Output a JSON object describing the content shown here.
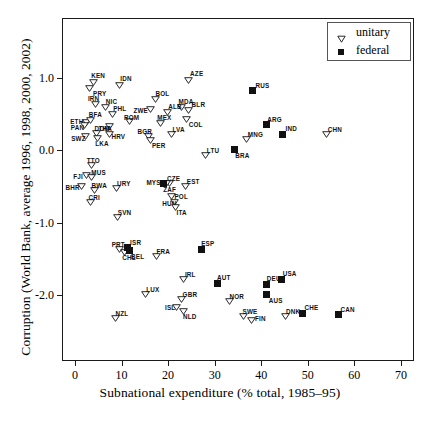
{
  "chart_data": {
    "type": "scatter",
    "title": "",
    "xlabel": "Subnational expenditure (% total, 1985–95)",
    "ylabel": "Corruption (World Bank, average 1996, 1998, 2000, 2002)",
    "xlim": [
      -3,
      73
    ],
    "ylim": [
      -2.75,
      1.45
    ],
    "xticks": [
      0,
      10,
      20,
      30,
      40,
      50,
      60,
      70
    ],
    "xticklabels": [
      "0",
      "10",
      "20",
      "30",
      "40",
      "50",
      "60",
      "70"
    ],
    "yticks": [
      1.0,
      0.0,
      -1.0,
      -2.0
    ],
    "yticklabels": [
      "1.0",
      "0.0",
      "-1.0",
      "-2.0"
    ],
    "grid": false,
    "legend": {
      "position": "top-right",
      "entries": [
        {
          "label": "unitary",
          "marker": "open-triangle-down"
        },
        {
          "label": "federal",
          "marker": "filled-square"
        }
      ]
    },
    "series": [
      {
        "name": "unitary",
        "marker": "open-triangle-down",
        "points": [
          {
            "label": "KEN",
            "x": 3.9,
            "y": 0.94,
            "lx": -2,
            "ly": -10
          },
          {
            "label": "PRY",
            "x": 3.0,
            "y": 0.85,
            "lx": 4,
            "ly": 2
          },
          {
            "label": "IDN",
            "x": 9.5,
            "y": 0.9,
            "lx": 1,
            "ly": -10
          },
          {
            "label": "AZE",
            "x": 24.3,
            "y": 0.97,
            "lx": 2,
            "ly": -10
          },
          {
            "label": "IRN",
            "x": 4.5,
            "y": 0.63,
            "lx": -8,
            "ly": -9
          },
          {
            "label": "NIC",
            "x": 6.6,
            "y": 0.6,
            "lx": 0,
            "ly": -9
          },
          {
            "label": "PHL",
            "x": 8.0,
            "y": 0.5,
            "lx": 1,
            "ly": -9
          },
          {
            "label": "BOL",
            "x": 17.3,
            "y": 0.7,
            "lx": 0,
            "ly": -9
          },
          {
            "label": "ZWE",
            "x": 16.2,
            "y": 0.57,
            "lx": -17,
            "ly": -2
          },
          {
            "label": "MDA",
            "x": 22.9,
            "y": 0.6,
            "lx": -3,
            "ly": -9
          },
          {
            "label": "BLR",
            "x": 24.4,
            "y": 0.55,
            "lx": 3,
            "ly": -9
          },
          {
            "label": "ALB",
            "x": 19.8,
            "y": 0.53,
            "lx": 1,
            "ly": -9
          },
          {
            "label": "COL",
            "x": 24.0,
            "y": 0.43,
            "lx": 2,
            "ly": 2
          },
          {
            "label": "ETH",
            "x": 2.4,
            "y": 0.39,
            "lx": -16,
            "ly": -4
          },
          {
            "label": "BFA",
            "x": 3.4,
            "y": 0.41,
            "lx": -2,
            "ly": -9
          },
          {
            "label": "THA",
            "x": 7.4,
            "y": 0.33,
            "lx": -11,
            "ly": -1
          },
          {
            "label": "ROM",
            "x": 11.8,
            "y": 0.4,
            "lx": -6,
            "ly": -7
          },
          {
            "label": "PAN",
            "x": 2.1,
            "y": 0.34,
            "lx": -14,
            "ly": -1
          },
          {
            "label": "DOM",
            "x": 4.6,
            "y": 0.24,
            "lx": -2,
            "ly": -8
          },
          {
            "label": "HRV",
            "x": 7.4,
            "y": 0.22,
            "lx": 2,
            "ly": -1
          },
          {
            "label": "LKA",
            "x": 4.8,
            "y": 0.17,
            "lx": -2,
            "ly": 2
          },
          {
            "label": "SWZ",
            "x": 2.2,
            "y": 0.19,
            "lx": -14,
            "ly": -1
          },
          {
            "label": "BGR",
            "x": 15.8,
            "y": 0.2,
            "lx": -11,
            "ly": -8
          },
          {
            "label": "PER",
            "x": 16.3,
            "y": 0.14,
            "lx": 1,
            "ly": 2
          },
          {
            "label": "MEX",
            "x": 18.3,
            "y": 0.38,
            "lx": -3,
            "ly": -9
          },
          {
            "label": "LVA",
            "x": 20.7,
            "y": 0.22,
            "lx": 1,
            "ly": -8
          },
          {
            "label": "MNG",
            "x": 36.9,
            "y": 0.15,
            "lx": 1,
            "ly": -8
          },
          {
            "label": "CHN",
            "x": 54.1,
            "y": 0.22,
            "lx": 1,
            "ly": -8
          },
          {
            "label": "LTU",
            "x": 28.1,
            "y": -0.07,
            "lx": 1,
            "ly": -8
          },
          {
            "label": "TTO",
            "x": 3.6,
            "y": -0.2,
            "lx": -5,
            "ly": -8
          },
          {
            "label": "FJI",
            "x": 2.4,
            "y": -0.35,
            "lx": -13,
            "ly": -2
          },
          {
            "label": "MUS",
            "x": 3.5,
            "y": -0.37,
            "lx": 0,
            "ly": -8
          },
          {
            "label": "BHR",
            "x": 1.4,
            "y": -0.49,
            "lx": -16,
            "ly": -2
          },
          {
            "label": "BWA",
            "x": 4.2,
            "y": -0.55,
            "lx": -3,
            "ly": -8
          },
          {
            "label": "URY",
            "x": 8.8,
            "y": -0.52,
            "lx": 1,
            "ly": -8
          },
          {
            "label": "CRI",
            "x": 3.3,
            "y": -0.72,
            "lx": -2,
            "ly": -8
          },
          {
            "label": "SVN",
            "x": 9.2,
            "y": -0.92,
            "lx": 0,
            "ly": -8
          },
          {
            "label": "CZE",
            "x": 20.2,
            "y": -0.45,
            "lx": -2,
            "ly": -8
          },
          {
            "label": "ZAF",
            "x": 19.6,
            "y": -0.45,
            "lx": -3,
            "ly": 3
          },
          {
            "label": "EST",
            "x": 23.8,
            "y": -0.5,
            "lx": 1,
            "ly": -8
          },
          {
            "label": "POL",
            "x": 20.7,
            "y": -0.63,
            "lx": 3,
            "ly": -3
          },
          {
            "label": "HUN",
            "x": 21.3,
            "y": -0.72,
            "lx": -12,
            "ly": -2
          },
          {
            "label": "ITA",
            "x": 21.6,
            "y": -0.78,
            "lx": 1,
            "ly": 2
          },
          {
            "label": "PRT",
            "x": 9.6,
            "y": -1.37,
            "lx": -8,
            "ly": -8
          },
          {
            "label": "CHL",
            "x": 10.6,
            "y": -1.4,
            "lx": -2,
            "ly": 2
          },
          {
            "label": "FRA",
            "x": 17.5,
            "y": -1.46,
            "lx": 0,
            "ly": -8
          },
          {
            "label": "IRL",
            "x": 23.4,
            "y": -1.78,
            "lx": 1,
            "ly": -8
          },
          {
            "label": "LUX",
            "x": 15.1,
            "y": -1.98,
            "lx": 1,
            "ly": -8
          },
          {
            "label": "GBR",
            "x": 22.9,
            "y": -2.05,
            "lx": 1,
            "ly": -8
          },
          {
            "label": "ISL",
            "x": 21.7,
            "y": -2.16,
            "lx": -11,
            "ly": -3
          },
          {
            "label": "NLD",
            "x": 23.2,
            "y": -2.22,
            "lx": 0,
            "ly": 2
          },
          {
            "label": "NZL",
            "x": 8.7,
            "y": -2.31,
            "lx": 0,
            "ly": -8
          },
          {
            "label": "NOR",
            "x": 33.2,
            "y": -2.08,
            "lx": 0,
            "ly": -8
          },
          {
            "label": "SWE",
            "x": 36.2,
            "y": -2.29,
            "lx": -1,
            "ly": -8
          },
          {
            "label": "FIN",
            "x": 38.0,
            "y": -2.35,
            "lx": 3,
            "ly": -5
          },
          {
            "label": "DNK",
            "x": 45.3,
            "y": -2.29,
            "lx": 0,
            "ly": -8
          }
        ]
      },
      {
        "name": "federal",
        "marker": "filled-square",
        "points": [
          {
            "label": "RUS",
            "x": 38.1,
            "y": 0.82,
            "lx": 3,
            "ly": -9
          },
          {
            "label": "ARG",
            "x": 41.1,
            "y": 0.35,
            "lx": 1,
            "ly": -9
          },
          {
            "label": "IND",
            "x": 44.6,
            "y": 0.22,
            "lx": 3,
            "ly": -9
          },
          {
            "label": "BRA",
            "x": 34.2,
            "y": 0.01,
            "lx": 1,
            "ly": 3
          },
          {
            "label": "MYS",
            "x": 19.0,
            "y": -0.46,
            "lx": -17,
            "ly": -4
          },
          {
            "label": "ISR",
            "x": 11.2,
            "y": -1.35,
            "lx": 3,
            "ly": -9
          },
          {
            "label": "BEL",
            "x": 11.6,
            "y": -1.39,
            "lx": 2,
            "ly": 2
          },
          {
            "label": "ESP",
            "x": 27.1,
            "y": -1.37,
            "lx": 0,
            "ly": -9
          },
          {
            "label": "AUT",
            "x": 30.5,
            "y": -1.84,
            "lx": 0,
            "ly": -9
          },
          {
            "label": "DEU",
            "x": 41.2,
            "y": -1.85,
            "lx": 0,
            "ly": -9
          },
          {
            "label": "USA",
            "x": 44.4,
            "y": -1.78,
            "lx": 1,
            "ly": -9
          },
          {
            "label": "AUS",
            "x": 41.2,
            "y": -1.99,
            "lx": 2,
            "ly": 3
          },
          {
            "label": "CHE",
            "x": 48.9,
            "y": -2.25,
            "lx": 2,
            "ly": -9
          },
          {
            "label": "CAN",
            "x": 56.6,
            "y": -2.27,
            "lx": 2,
            "ly": -9
          }
        ]
      }
    ]
  },
  "legend": {
    "unitary_label": "unitary",
    "federal_label": "federal"
  },
  "axes": {
    "x_title": "Subnational expenditure (% total, 1985–95)",
    "y_title": "Corruption (World Bank, average 1996, 1998, 2000, 2002)"
  }
}
